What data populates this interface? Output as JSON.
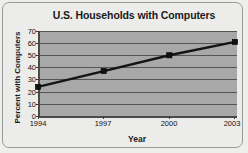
{
  "chart_data": {
    "type": "line",
    "title": "U.S. Households with Computers",
    "xlabel": "Year",
    "ylabel": "Percent with Computers",
    "categories": [
      "1994",
      "1997",
      "2000",
      "2003"
    ],
    "x": [
      1994,
      1997,
      2000,
      2003
    ],
    "values": [
      24,
      37,
      50,
      61
    ],
    "series": [
      {
        "name": "Percent with Computers",
        "values": [
          24,
          37,
          50,
          61
        ]
      }
    ],
    "ylim": [
      0,
      70
    ],
    "yticks": [
      0,
      10,
      20,
      30,
      40,
      50,
      60,
      70
    ],
    "ytick_labels": [
      "0",
      "10",
      "20",
      "30",
      "40",
      "50",
      "60",
      "70"
    ],
    "xtick_labels": [
      "1994",
      "1997",
      "2000",
      "2003"
    ],
    "grid": "horizontal",
    "legend": "none",
    "marker": "square",
    "colors": {
      "line": "#1a1a1a",
      "marker": "#111111",
      "plot_background": "#a8a8a8",
      "figure_background": "#ececea",
      "gridline": "#555555",
      "axis": "#4a4a4a",
      "text": "#1a1a1a"
    }
  }
}
